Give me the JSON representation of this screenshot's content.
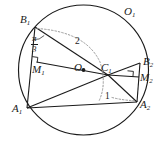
{
  "figure": {
    "type": "geometry-diagram",
    "background_color": "#ffffff",
    "stroke_color": "#1a1a1a",
    "dotted_color": "#8a8a8a",
    "circle": {
      "label": "O₁",
      "center_label": "O",
      "cx": 83.5,
      "cy": 70,
      "r": 65
    },
    "labels": {
      "circle_name": "O",
      "circle_name_sub": "1",
      "center": "O",
      "b1": "B",
      "b1_sub": "1",
      "b2": "B",
      "b2_sub": "2",
      "a1": "A",
      "a1_sub": "1",
      "a2": "A",
      "a2_sub": "2",
      "c1": "C",
      "c1_sub": "1",
      "m1": "M",
      "m1_sub": "1",
      "m2": "M",
      "m2_sub": "2",
      "arc_two": "2",
      "arc_one": "1"
    },
    "angle": {
      "numerator": "π",
      "denominator": "3"
    },
    "points": {
      "B1": [
        35,
        27
      ],
      "A1": [
        27,
        108
      ],
      "M1": [
        36.5,
        62
      ],
      "C1": [
        108,
        75
      ],
      "O": [
        83.5,
        70
      ],
      "B2": [
        140,
        63
      ],
      "M2": [
        139,
        77
      ],
      "A2": [
        137,
        102
      ]
    },
    "right_angle_marks": [
      "M₁",
      "M₂"
    ]
  }
}
